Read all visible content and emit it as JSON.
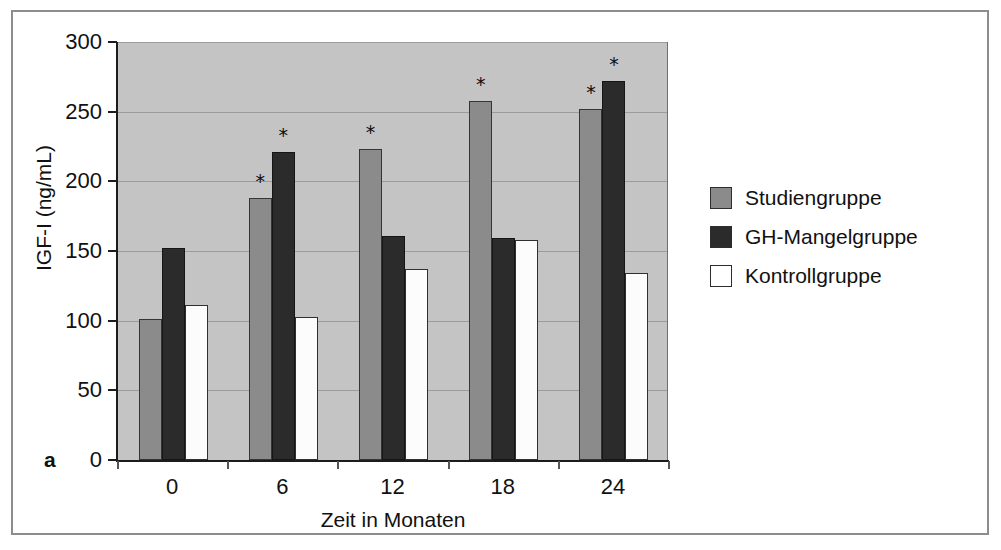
{
  "figure": {
    "panel_letter": "a"
  },
  "legend": {
    "position": "right",
    "items": [
      {
        "label": "Studiengruppe",
        "color": "#8b8b8b"
      },
      {
        "label": "GH-Mangelgruppe",
        "color": "#2b2b2b"
      },
      {
        "label": "Kontrollgruppe",
        "color": "#ffffff"
      }
    ]
  },
  "chart_data": {
    "type": "bar",
    "title": "",
    "xlabel": "Zeit in Monaten",
    "ylabel": "IGF-I (ng/mL)",
    "categories": [
      "0",
      "6",
      "12",
      "18",
      "24"
    ],
    "ylim": [
      0,
      300
    ],
    "yticks": [
      0,
      50,
      100,
      150,
      200,
      250,
      300
    ],
    "ytick_labels": [
      "0",
      "50",
      "100",
      "150",
      "200",
      "250",
      "300"
    ],
    "grid": true,
    "plot_background": "#c4c4c4",
    "series": [
      {
        "name": "Studiengruppe",
        "color": "#8b8b8b",
        "values": [
          101,
          188,
          223,
          258,
          252
        ],
        "significant": [
          false,
          true,
          true,
          true,
          true
        ]
      },
      {
        "name": "GH-Mangelgruppe",
        "color": "#2b2b2b",
        "values": [
          152,
          221,
          161,
          159,
          272
        ],
        "significant": [
          false,
          true,
          false,
          false,
          true
        ]
      },
      {
        "name": "Kontrollgruppe",
        "color": "#ffffff",
        "values": [
          111,
          103,
          137,
          158,
          134
        ],
        "significant": [
          false,
          false,
          false,
          false,
          false
        ]
      }
    ],
    "significance_marker": "*"
  }
}
